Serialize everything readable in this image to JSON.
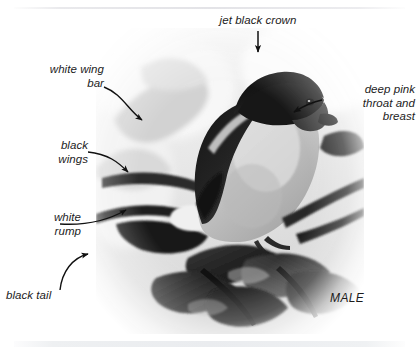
{
  "figure": {
    "sex_caption": "MALE",
    "image_style": "black-and-white photograph with soft white vignette"
  },
  "annotations": [
    {
      "id": "crown",
      "text": "jet black crown",
      "align": "center",
      "position": "top-center",
      "arrow": "straight-down"
    },
    {
      "id": "wing-bar",
      "text": "white wing\nbar",
      "align": "right",
      "position": "upper-left",
      "arrow": "curved-down-right"
    },
    {
      "id": "wings",
      "text": "black\nwings",
      "align": "right",
      "position": "mid-left",
      "arrow": "curved-right-down"
    },
    {
      "id": "rump",
      "text": "white\nrump",
      "align": "right",
      "position": "lower-left",
      "arrow": "curved-right-up"
    },
    {
      "id": "tail",
      "text": "black tail",
      "align": "left",
      "position": "bottom-left",
      "arrow": "curved-up-right"
    },
    {
      "id": "breast",
      "text": "deep pink\nthroat and\nbreast",
      "align": "right",
      "position": "right",
      "arrow": "straight-left"
    }
  ],
  "colors": {
    "text": "#1c1c1c",
    "arrow": "#111111",
    "rule": "#e8e9ec",
    "page_background": "#ffffff"
  }
}
